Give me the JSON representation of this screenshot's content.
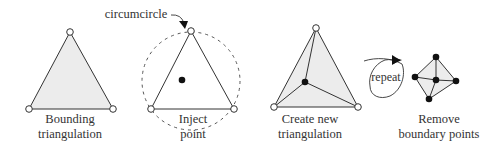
{
  "diagram": {
    "colors": {
      "stroke": "#333333",
      "fill": "#ececec",
      "dash": "#555555",
      "open_point": "#ffffff",
      "filled_point": "#111111"
    },
    "steps": [
      {
        "id": "bounding",
        "label_line1": "Bounding",
        "label_line2": "triangulation"
      },
      {
        "id": "inject",
        "label_line1": "Inject",
        "label_line2": "point",
        "annotation": "circumcircle"
      },
      {
        "id": "create",
        "label_line1": "Create new",
        "label_line2": "triangulation"
      },
      {
        "id": "remove",
        "label_line1": "Remove",
        "label_line2": "boundary points"
      }
    ],
    "loop_label": "repeat"
  }
}
